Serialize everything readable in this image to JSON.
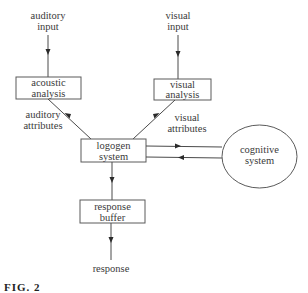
{
  "diagram": {
    "inputs": {
      "auditory": [
        "auditory",
        "input"
      ],
      "visual": [
        "visual",
        "input"
      ]
    },
    "boxes": {
      "acoustic_analysis": [
        "acoustic",
        "analysis"
      ],
      "visual_analysis": [
        "visual",
        "analysis"
      ],
      "logogen_system": [
        "logogen",
        "system"
      ],
      "response_buffer": [
        "response",
        "buffer"
      ]
    },
    "edge_labels": {
      "auditory_attributes": [
        "auditory",
        "attributes"
      ],
      "visual_attributes": [
        "visual",
        "attributes"
      ]
    },
    "cognitive_system": [
      "cognitive",
      "system"
    ],
    "output": "response",
    "caption": "FIG. 2"
  }
}
